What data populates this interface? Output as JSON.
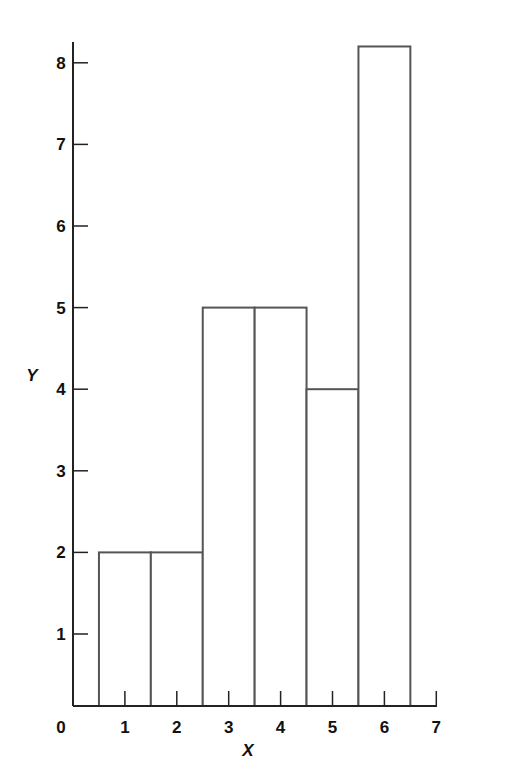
{
  "chart_data": {
    "type": "bar",
    "subtype": "histogram",
    "title": "",
    "xlabel": "X",
    "ylabel": "Y",
    "categories": [
      "1",
      "2",
      "3",
      "4",
      "5",
      "6"
    ],
    "x": [
      1,
      2,
      3,
      4,
      5,
      6
    ],
    "values": [
      2,
      2,
      5,
      5,
      4,
      8.2
    ],
    "bar_width": 1,
    "xlim": [
      0,
      7
    ],
    "ylim": [
      0,
      8.3
    ],
    "x_ticks": [
      0,
      1,
      2,
      3,
      4,
      5,
      6,
      7
    ],
    "y_ticks": [
      1,
      2,
      3,
      4,
      5,
      6,
      7,
      8
    ],
    "grid": false,
    "legend": null,
    "bar_fill": "#ffffff",
    "bar_stroke": "#555555",
    "axis_color": "#222222"
  }
}
